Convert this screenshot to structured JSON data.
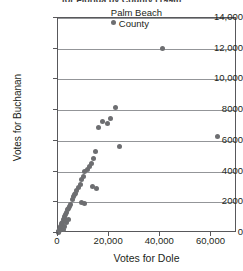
{
  "chart_data": {
    "type": "scatter",
    "title": "for Florida by County (1996)",
    "xlabel": "Votes for Dole",
    "ylabel": "Votes for Buchanan",
    "xlim": [
      0,
      70000
    ],
    "ylim": [
      0,
      14000
    ],
    "grid": true,
    "legend": null,
    "xticks": [
      0,
      20000,
      40000,
      60000
    ],
    "xtick_labels": [
      "0",
      "20,000",
      "40,000",
      "60,000"
    ],
    "yticks": [
      0,
      2000,
      4000,
      6000,
      8000,
      10000,
      12000,
      14000
    ],
    "ytick_labels": [
      "0",
      "2000",
      "4000",
      "6000",
      "8000",
      "10,000",
      "12,000",
      "14,000"
    ],
    "marker_color": "#6d6e71",
    "annotations": [
      {
        "text_line1": "Palm Beach",
        "text_line2": "County",
        "x": 41000,
        "y": 12000
      }
    ],
    "points": [
      {
        "x": 41000,
        "y": 12000,
        "label": "Palm Beach County"
      },
      {
        "x": 22500,
        "y": 8200
      },
      {
        "x": 20500,
        "y": 7450
      },
      {
        "x": 19200,
        "y": 7100
      },
      {
        "x": 17500,
        "y": 7250
      },
      {
        "x": 16000,
        "y": 6900
      },
      {
        "x": 62500,
        "y": 6300
      },
      {
        "x": 24000,
        "y": 5650
      },
      {
        "x": 14800,
        "y": 5300
      },
      {
        "x": 13700,
        "y": 4850
      },
      {
        "x": 13200,
        "y": 4500
      },
      {
        "x": 12300,
        "y": 4300
      },
      {
        "x": 11400,
        "y": 4150
      },
      {
        "x": 10500,
        "y": 4000
      },
      {
        "x": 10000,
        "y": 3700
      },
      {
        "x": 9200,
        "y": 3500
      },
      {
        "x": 13500,
        "y": 3000
      },
      {
        "x": 15000,
        "y": 2900
      },
      {
        "x": 8700,
        "y": 3150
      },
      {
        "x": 8000,
        "y": 2950
      },
      {
        "x": 7400,
        "y": 2800
      },
      {
        "x": 7000,
        "y": 2600
      },
      {
        "x": 6500,
        "y": 2500
      },
      {
        "x": 6000,
        "y": 2350
      },
      {
        "x": 5600,
        "y": 2150
      },
      {
        "x": 9000,
        "y": 2000
      },
      {
        "x": 10200,
        "y": 1950
      },
      {
        "x": 5000,
        "y": 1850
      },
      {
        "x": 4600,
        "y": 1700
      },
      {
        "x": 4200,
        "y": 1600
      },
      {
        "x": 3800,
        "y": 1500
      },
      {
        "x": 3400,
        "y": 1350
      },
      {
        "x": 3000,
        "y": 1200
      },
      {
        "x": 2700,
        "y": 1050
      },
      {
        "x": 2400,
        "y": 950
      },
      {
        "x": 2100,
        "y": 850
      },
      {
        "x": 1800,
        "y": 700
      },
      {
        "x": 1500,
        "y": 600
      },
      {
        "x": 1250,
        "y": 520
      },
      {
        "x": 1050,
        "y": 420
      },
      {
        "x": 850,
        "y": 340
      },
      {
        "x": 650,
        "y": 260
      },
      {
        "x": 500,
        "y": 180
      },
      {
        "x": 350,
        "y": 120
      },
      {
        "x": 220,
        "y": 70
      },
      {
        "x": 120,
        "y": 30
      },
      {
        "x": 2000,
        "y": 250
      },
      {
        "x": 2600,
        "y": 420
      },
      {
        "x": 3200,
        "y": 700
      },
      {
        "x": 4000,
        "y": 900
      }
    ]
  }
}
